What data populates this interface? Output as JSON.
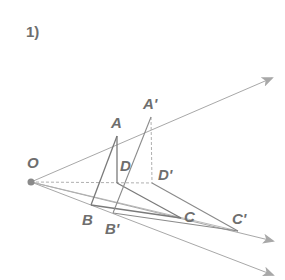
{
  "problem_number": "1)",
  "colors": {
    "ray": "#a8a8a8",
    "edge": "#7a7a7a",
    "dashed": "#b0b0b0",
    "label": "#6e6e6e",
    "point": "#8a8a8a"
  },
  "points": {
    "O": {
      "label": "O",
      "x": 31,
      "y": 182
    },
    "A": {
      "label": "A",
      "x": 117,
      "y": 136
    },
    "A_prime": {
      "label": "A'",
      "x": 151,
      "y": 117
    },
    "B": {
      "label": "B",
      "x": 91,
      "y": 205
    },
    "B_prime": {
      "label": "B'",
      "x": 113,
      "y": 213
    },
    "C": {
      "label": "C",
      "x": 181,
      "y": 218
    },
    "C_prime": {
      "label": "C'",
      "x": 238,
      "y": 231
    },
    "D": {
      "label": "D",
      "x": 117,
      "y": 183
    },
    "D_prime": {
      "label": "D'",
      "x": 152,
      "y": 183
    }
  },
  "labels": {
    "O": "O",
    "A": "A",
    "A_prime": "A'",
    "B": "B",
    "B_prime": "B'",
    "C": "C",
    "C_prime": "C'",
    "D": "D",
    "D_prime": "D'"
  }
}
